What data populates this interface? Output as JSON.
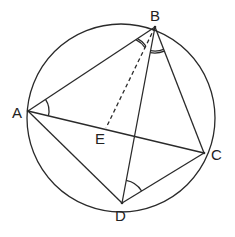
{
  "diagram": {
    "type": "cyclic-quadrilateral-geometry",
    "circle": {
      "cx": 121,
      "cy": 118,
      "r": 94
    },
    "points": {
      "A": {
        "x": 28,
        "y": 111,
        "label": "A",
        "lx": 12,
        "ly": 118
      },
      "B": {
        "x": 155,
        "y": 27,
        "label": "B",
        "lx": 152,
        "ly": 21
      },
      "C": {
        "x": 204,
        "y": 153,
        "label": "C",
        "lx": 212,
        "ly": 160
      },
      "D": {
        "x": 122,
        "y": 203,
        "label": "D",
        "lx": 115,
        "ly": 221
      },
      "E": {
        "x": 106,
        "y": 128,
        "label": "E",
        "lx": 95,
        "ly": 144
      }
    },
    "segments": [
      {
        "from": "A",
        "to": "B",
        "style": "solid"
      },
      {
        "from": "B",
        "to": "C",
        "style": "solid"
      },
      {
        "from": "C",
        "to": "D",
        "style": "solid"
      },
      {
        "from": "D",
        "to": "A",
        "style": "solid"
      },
      {
        "from": "A",
        "to": "C",
        "style": "solid"
      },
      {
        "from": "B",
        "to": "D",
        "style": "solid"
      },
      {
        "from": "B",
        "to": "E",
        "style": "dashed"
      }
    ],
    "angle_marks": [
      {
        "vertex": "A",
        "between": [
          "B",
          "C"
        ],
        "arcs": 1
      },
      {
        "vertex": "B",
        "between": [
          "A",
          "E"
        ],
        "arcs": 2
      },
      {
        "vertex": "B",
        "between": [
          "D",
          "C"
        ],
        "arcs": 2
      },
      {
        "vertex": "D",
        "between": [
          "B",
          "C"
        ],
        "arcs": 1
      }
    ],
    "stroke_color": "#2a2a2a"
  }
}
